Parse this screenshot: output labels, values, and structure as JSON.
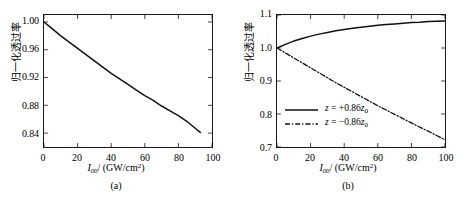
{
  "figure": {
    "background": "#ffffff",
    "line_color": "#111111"
  },
  "panels": [
    {
      "id": "a",
      "caption": "(a)",
      "xlabel_main": "I",
      "xlabel_sub": "00",
      "xlabel_rest": "/ (GW/cm",
      "xlabel_sup": "2",
      "xlabel_tail": ")",
      "ylabel": "归一化透过率",
      "xticks": [
        "0",
        "20",
        "40",
        "60",
        "80",
        "100"
      ],
      "yticks": [
        "1.00",
        "0.96",
        "0.92",
        "0.88",
        "0.84"
      ]
    },
    {
      "id": "b",
      "caption": "(b)",
      "xlabel_main": "I",
      "xlabel_sub": "00",
      "xlabel_rest": "/ (GW/cm",
      "xlabel_sup": "2",
      "xlabel_tail": ")",
      "ylabel": "归一化透过率",
      "xticks": [
        "0",
        "20",
        "40",
        "60",
        "80",
        "100"
      ],
      "yticks": [
        "1.1",
        "1.0",
        "0.9",
        "0.8",
        "0.7"
      ],
      "legend": [
        {
          "style": "solid",
          "var": "z",
          "eq": " = +0.86",
          "zvar": "z",
          "zsub": "0"
        },
        {
          "style": "dashdot",
          "var": "z",
          "eq": " = −0.86",
          "zvar": "z",
          "zsub": "0"
        }
      ]
    }
  ],
  "chart_data": [
    {
      "type": "line",
      "panel": "a",
      "title": "",
      "xlabel": "I00/ (GW/cm2)",
      "ylabel": "归一化透过率",
      "xlim": [
        0,
        100
      ],
      "ylim": [
        0.82,
        1.01
      ],
      "xticks": [
        0,
        20,
        40,
        60,
        80,
        100
      ],
      "yticks": [
        0.84,
        0.88,
        0.92,
        0.96,
        1.0
      ],
      "grid": false,
      "legend": "none",
      "series": [
        {
          "name": "normalized transmittance",
          "style": "solid",
          "color": "#111111",
          "x": [
            0,
            5,
            10,
            15,
            20,
            25,
            30,
            35,
            40,
            45,
            50,
            55,
            60,
            65,
            70,
            75,
            80,
            85,
            90,
            93
          ],
          "y": [
            1.0,
            0.99,
            0.98,
            0.971,
            0.962,
            0.953,
            0.944,
            0.935,
            0.926,
            0.918,
            0.91,
            0.902,
            0.894,
            0.887,
            0.879,
            0.872,
            0.865,
            0.857,
            0.847,
            0.841
          ]
        }
      ]
    },
    {
      "type": "line",
      "panel": "b",
      "title": "",
      "xlabel": "I00/ (GW/cm2)",
      "ylabel": "归一化透过率",
      "xlim": [
        0,
        100
      ],
      "ylim": [
        0.7,
        1.1
      ],
      "xticks": [
        0,
        20,
        40,
        60,
        80,
        100
      ],
      "yticks": [
        0.7,
        0.8,
        0.9,
        1.0,
        1.1
      ],
      "grid": false,
      "legend": "inside-left-lower",
      "series": [
        {
          "name": "z = +0.86z0",
          "style": "solid",
          "color": "#111111",
          "x": [
            0,
            5,
            10,
            15,
            20,
            25,
            30,
            35,
            40,
            45,
            50,
            55,
            60,
            65,
            70,
            75,
            80,
            85,
            90,
            95,
            100
          ],
          "y": [
            1.0,
            1.011,
            1.021,
            1.029,
            1.036,
            1.042,
            1.047,
            1.052,
            1.056,
            1.06,
            1.063,
            1.066,
            1.069,
            1.071,
            1.073,
            1.075,
            1.077,
            1.078,
            1.08,
            1.081,
            1.082
          ]
        },
        {
          "name": "z = −0.86z0",
          "style": "dashdot",
          "color": "#111111",
          "x": [
            0,
            5,
            10,
            15,
            20,
            25,
            30,
            35,
            40,
            45,
            50,
            55,
            60,
            65,
            70,
            75,
            80,
            85,
            90,
            95,
            100
          ],
          "y": [
            1.0,
            0.985,
            0.97,
            0.955,
            0.94,
            0.925,
            0.91,
            0.895,
            0.881,
            0.867,
            0.853,
            0.839,
            0.825,
            0.812,
            0.799,
            0.786,
            0.773,
            0.76,
            0.748,
            0.735,
            0.722
          ]
        }
      ]
    }
  ]
}
